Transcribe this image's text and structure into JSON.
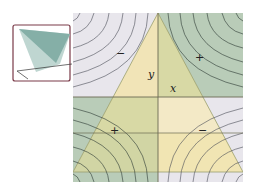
{
  "figure": {
    "colors": {
      "positive_region": "#b9ccb8",
      "negative_region": "#e8e6ec",
      "triangle_fill": "#f1e4b2",
      "triangle_overlap_green": "#d4d7a2",
      "contour_line": "#2d3a33",
      "axis_line": "#6b6a52",
      "inset_border": "#7a3a48",
      "inset_surface_dark": "#7aa8a0",
      "inset_surface_light": "#b8d2cc"
    },
    "labels": {
      "y_axis": "y",
      "x_axis": "x"
    },
    "signs": {
      "top_left": "−",
      "top_right": "+",
      "bottom_left": "+",
      "bottom_right": "−"
    },
    "inset": {
      "title": "saddle surface 3D view"
    }
  }
}
